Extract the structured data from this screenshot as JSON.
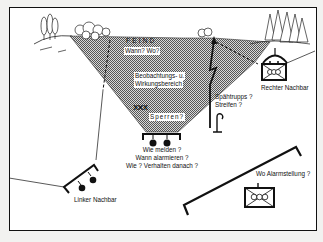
{
  "diagram": {
    "labels": {
      "enemy": "FEIND",
      "enemy_question": "Wann? Wo?",
      "observation_area_line1": "Beobachtungs- u.",
      "observation_area_line2": "Wirkungsbereich",
      "obstacles": "Sperren?",
      "obstacle_symbol": "XXX",
      "report_q1": "Wie melden ?",
      "report_q2": "Wann alarmieren ?",
      "report_q3": "Wie ?  Verhalten danach ?",
      "patrols_line1": "Spähtrupps ?",
      "patrols_line2": "Streifen ?",
      "right_neighbor": "Rechter Nachbar",
      "left_neighbor": "Linker Nachbar",
      "alarm_position": "Wo Alarmstellung ?"
    },
    "colors": {
      "ink": "#111111",
      "paper": "#ffffff",
      "hatch": "#8a8a8a"
    }
  }
}
